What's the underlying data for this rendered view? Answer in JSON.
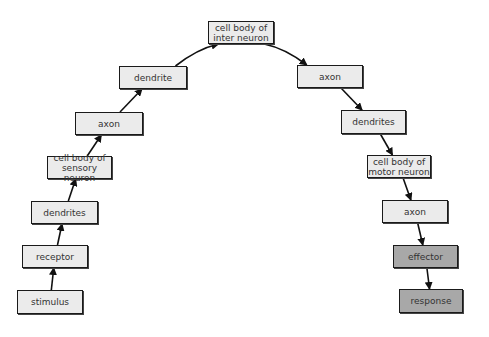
{
  "diagram": {
    "type": "reflex-arc-flowchart",
    "colors": {
      "light_fill": "#ebebeb",
      "dark_fill": "#a8a8a8",
      "border": "#1a1a1a",
      "arrow": "#111111"
    },
    "nodes": [
      {
        "id": "stimulus",
        "label": "stimulus",
        "x": 17,
        "y": 290,
        "w": 66,
        "h": 24,
        "style": "light"
      },
      {
        "id": "receptor",
        "label": "receptor",
        "x": 22,
        "y": 245,
        "w": 66,
        "h": 23,
        "style": "light"
      },
      {
        "id": "dendrites_sensory",
        "label": "dendrites",
        "x": 31,
        "y": 201,
        "w": 67,
        "h": 23,
        "style": "light"
      },
      {
        "id": "cell_body_sensory",
        "label": "cell body of sensory neuron",
        "x": 47,
        "y": 156,
        "w": 65,
        "h": 23,
        "style": "light"
      },
      {
        "id": "axon_sensory",
        "label": "axon",
        "x": 75,
        "y": 112,
        "w": 68,
        "h": 23,
        "style": "light"
      },
      {
        "id": "dendrite_inter",
        "label": "dendrite",
        "x": 119,
        "y": 66,
        "w": 68,
        "h": 23,
        "style": "light"
      },
      {
        "id": "cell_body_inter",
        "label": "cell body of inter neuron",
        "x": 208,
        "y": 21,
        "w": 66,
        "h": 23,
        "style": "light"
      },
      {
        "id": "axon_inter",
        "label": "axon",
        "x": 297,
        "y": 65,
        "w": 66,
        "h": 23,
        "style": "light"
      },
      {
        "id": "dendrites_motor",
        "label": "dendrites",
        "x": 341,
        "y": 110,
        "w": 65,
        "h": 24,
        "style": "light"
      },
      {
        "id": "cell_body_motor",
        "label": "cell body of motor neuron",
        "x": 367,
        "y": 155,
        "w": 64,
        "h": 23,
        "style": "light"
      },
      {
        "id": "axon_motor",
        "label": "axon",
        "x": 382,
        "y": 200,
        "w": 66,
        "h": 23,
        "style": "light"
      },
      {
        "id": "effector",
        "label": "effector",
        "x": 393,
        "y": 245,
        "w": 65,
        "h": 23,
        "style": "dark"
      },
      {
        "id": "response",
        "label": "response",
        "x": 399,
        "y": 289,
        "w": 64,
        "h": 24,
        "style": "dark"
      }
    ],
    "edges": [
      {
        "from": "stimulus",
        "to": "receptor"
      },
      {
        "from": "receptor",
        "to": "dendrites_sensory"
      },
      {
        "from": "dendrites_sensory",
        "to": "cell_body_sensory"
      },
      {
        "from": "cell_body_sensory",
        "to": "axon_sensory"
      },
      {
        "from": "axon_sensory",
        "to": "dendrite_inter"
      },
      {
        "from": "dendrite_inter",
        "to": "cell_body_inter"
      },
      {
        "from": "cell_body_inter",
        "to": "axon_inter"
      },
      {
        "from": "axon_inter",
        "to": "dendrites_motor"
      },
      {
        "from": "dendrites_motor",
        "to": "cell_body_motor"
      },
      {
        "from": "cell_body_motor",
        "to": "axon_motor"
      },
      {
        "from": "axon_motor",
        "to": "effector"
      },
      {
        "from": "effector",
        "to": "response"
      }
    ]
  }
}
